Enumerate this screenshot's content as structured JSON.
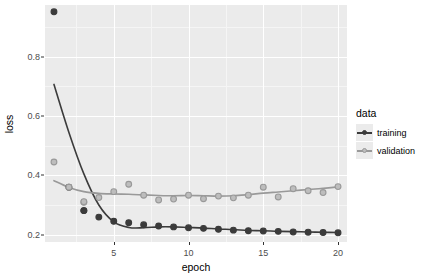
{
  "chart_data": {
    "type": "scatter",
    "title": "",
    "xlabel": "epoch",
    "ylabel": "loss",
    "xlim": [
      0.4,
      20.6
    ],
    "ylim": [
      0.175,
      0.975
    ],
    "xticks": [
      5,
      10,
      15,
      20
    ],
    "xtick_labels": [
      "5",
      "10",
      "15",
      "20"
    ],
    "yticks": [
      0.2,
      0.4,
      0.6,
      0.8
    ],
    "ytick_labels": [
      "0.2",
      "0.4",
      "0.6",
      "0.8"
    ],
    "grid": true,
    "legend_position": "right",
    "legend_title": "data",
    "x": [
      1,
      2,
      3,
      4,
      5,
      6,
      7,
      8,
      9,
      10,
      11,
      12,
      13,
      14,
      15,
      16,
      17,
      18,
      19,
      20
    ],
    "series": [
      {
        "name": "training",
        "color": "#3b3b3b",
        "values": [
          0.952,
          0.36,
          0.281,
          0.259,
          0.245,
          0.24,
          0.233,
          0.229,
          0.226,
          0.223,
          0.221,
          0.218,
          0.215,
          0.213,
          0.212,
          0.211,
          0.209,
          0.208,
          0.207,
          0.206
        ],
        "smooth": [
          0.707,
          0.545,
          0.405,
          0.3,
          0.243,
          0.224,
          0.223,
          0.226,
          0.226,
          0.224,
          0.222,
          0.219,
          0.217,
          0.214,
          0.213,
          0.211,
          0.21,
          0.209,
          0.208,
          0.207
        ]
      },
      {
        "name": "validation",
        "color": "#999999",
        "values": [
          0.445,
          0.36,
          0.309,
          0.325,
          0.345,
          0.37,
          0.333,
          0.317,
          0.32,
          0.333,
          0.321,
          0.33,
          0.324,
          0.333,
          0.36,
          0.327,
          0.355,
          0.348,
          0.342,
          0.362
        ],
        "smooth": [
          0.382,
          0.359,
          0.345,
          0.339,
          0.337,
          0.336,
          0.334,
          0.332,
          0.331,
          0.332,
          0.331,
          0.33,
          0.331,
          0.335,
          0.34,
          0.344,
          0.348,
          0.352,
          0.356,
          0.361
        ]
      }
    ],
    "extra_points": [
      {
        "series": "validation",
        "x": 3,
        "y": 0.311
      },
      {
        "series": "training",
        "x": 3,
        "y": 0.281
      }
    ]
  },
  "legend": {
    "title": "data",
    "entries": [
      {
        "label": "training",
        "color": "#3b3b3b"
      },
      {
        "label": "validation",
        "color": "#999999"
      }
    ]
  },
  "axes": {
    "x_title": "epoch",
    "y_title": "loss"
  },
  "colors": {
    "panel_background": "#ebebeb",
    "grid_major": "#ffffff",
    "grid_minor": "#f5f5f5",
    "training": "#3b3b3b",
    "validation": "#999999",
    "text": "#000000",
    "tick_text": "#4d4d4d"
  }
}
